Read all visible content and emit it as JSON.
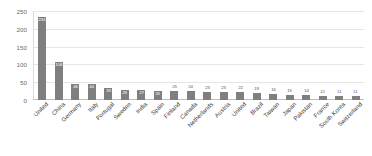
{
  "chart_data": {
    "type": "bar",
    "title": "",
    "subtitle": "",
    "xlabel": "",
    "ylabel": "",
    "ylim": [
      0,
      250
    ],
    "yticks": [
      250,
      200,
      150,
      100,
      50,
      0
    ],
    "grid": true,
    "legend": false,
    "legend_position": "none",
    "bar_color": "#7f7f7f",
    "categories": [
      "United",
      "China",
      "Germany",
      "Italy",
      "Portugal",
      "Sweden",
      "India",
      "Spain",
      "Finland",
      "Canada",
      "Netherlands",
      "Austria",
      "United",
      "Brazil",
      "Taiwan",
      "Japan",
      "Pakistan",
      "France",
      "South Korea",
      "Switzerland"
    ],
    "values": [
      234,
      108,
      46,
      44,
      33,
      28,
      27,
      26,
      25,
      24,
      23,
      23,
      22,
      19,
      16,
      15,
      14,
      12,
      11,
      11
    ],
    "labels": [
      "234",
      "108",
      "46",
      "44",
      "33",
      "28",
      "27",
      "26",
      "25",
      "24",
      "23",
      "23",
      "22",
      "19",
      "16",
      "15",
      "14",
      "12",
      "11",
      "11"
    ]
  }
}
